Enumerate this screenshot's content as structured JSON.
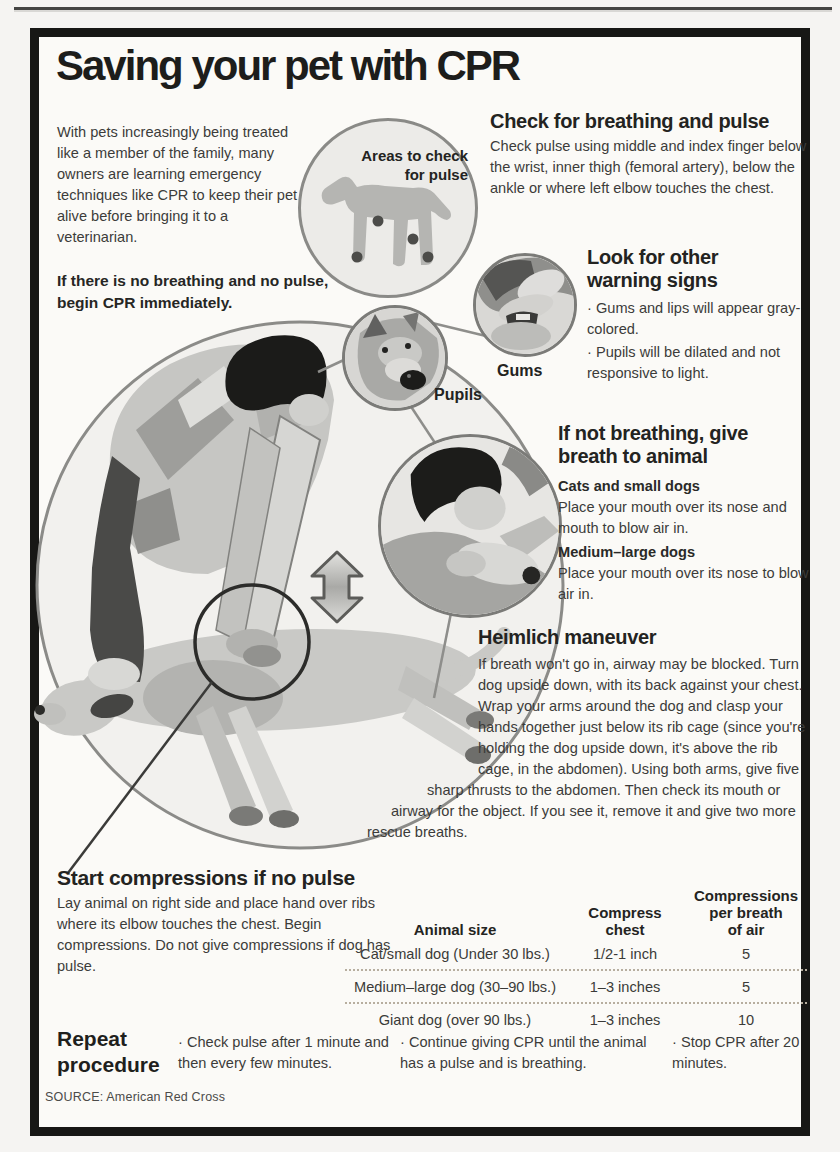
{
  "colors": {
    "box_border": "#171715",
    "paper": "#fbfaf7",
    "illustration_light_gray": "#c9c9c6",
    "illustration_dark": "#1b1b19",
    "text": "#3c3c3a"
  },
  "icons": {
    "compression_arrow": "double-vertical-arrow",
    "pulse_point_dots": "filled-circle"
  },
  "title": "Saving your pet with CPR",
  "intro": "With pets increasingly being treated like a member of the family, many owners are learning emergency techniques like CPR to keep their pet alive before bringing it to a veterinarian.",
  "cpr_note": "If there is no breathing and no pulse, begin CPR immediately.",
  "pulse_circle": {
    "label_lines": [
      "Areas to check",
      "for pulse"
    ]
  },
  "callouts": {
    "pupils_label": "Pupils",
    "gums_label": "Gums"
  },
  "sections": {
    "breathing_pulse": {
      "title": "Check for breathing and pulse",
      "body": "Check pulse using middle and index finger below the wrist, inner thigh (femoral artery), below the ankle or where left elbow touches the chest."
    },
    "warning_signs": {
      "title_lines": [
        "Look for other",
        "warning signs"
      ],
      "bullets": [
        "· Gums and lips will appear gray- colored.",
        "· Pupils will be dilated and not responsive to light."
      ]
    },
    "give_breath": {
      "title_lines": [
        "If not breathing, give",
        "breath to animal"
      ],
      "subsections": [
        {
          "title": "Cats and small dogs",
          "body": "Place your mouth over its nose and mouth to blow air in."
        },
        {
          "title": "Medium–large dogs",
          "body": "Place your mouth over its nose to blow air in."
        }
      ]
    },
    "heimlich": {
      "title": "Heimlich maneuver",
      "body": "If breath won't go in, airway may be blocked. Turn dog upside down, with its back against your chest. Wrap your arms around the dog and clasp your hands together just below its rib cage (since you're holding the dog upside down, it's above the rib cage, in the abdomen). Using both arms, give five sharp thrusts to the abdomen. Then check its mouth or airway for the object. If you see it, remove it and give two more rescue breaths."
    },
    "compressions": {
      "title": "Start compressions if no pulse",
      "body": "Lay animal on right side and place hand over ribs where its elbow touches the chest. Begin compressions. Do not give compressions if dog has pulse."
    },
    "repeat": {
      "title_lines": [
        "Repeat",
        "procedure"
      ],
      "bullets": [
        "· Check pulse after 1 minute and then every few minutes.",
        "· Continue giving CPR until the animal has a pulse and is breathing.",
        "· Stop CPR after 20 minutes."
      ]
    }
  },
  "table": {
    "header": {
      "animal": "Animal size",
      "compress_lines": [
        "Compress",
        "chest"
      ],
      "breaths_lines": [
        "Compressions",
        "per breath",
        "of air"
      ]
    },
    "rows": [
      {
        "animal": "Cat/small dog (Under 30 lbs.)",
        "compress": "1/2-1 inch",
        "count": "5"
      },
      {
        "animal": "Medium–large dog (30–90 lbs.)",
        "compress": "1–3 inches",
        "count": "5"
      },
      {
        "animal": "Giant dog (over 90 lbs.)",
        "compress": "1–3 inches",
        "count": "10"
      }
    ]
  },
  "source": "SOURCE: American Red Cross"
}
